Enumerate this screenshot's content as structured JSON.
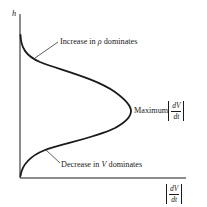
{
  "diagram": {
    "y_axis_label": "h",
    "x_axis_label": {
      "numerator": "dV",
      "denominator": "dt",
      "abs": true
    },
    "annotations": {
      "top": {
        "prefix": "Increase in ",
        "symbol": "ρ",
        "suffix": " dominates"
      },
      "peak": {
        "text": "Maximum",
        "numerator": "dV",
        "denominator": "dt"
      },
      "bottom": {
        "prefix": "Decrease in ",
        "symbol": "V",
        "suffix": " dominates"
      }
    },
    "colors": {
      "line": "#1a1a1a",
      "background": "#ffffff"
    }
  }
}
